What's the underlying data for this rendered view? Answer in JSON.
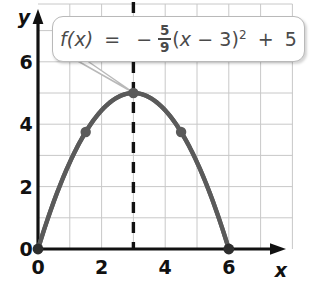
{
  "figure": {
    "axis_labels": {
      "x": "x",
      "y": "y"
    },
    "x_ticks": [
      "0",
      "2",
      "4",
      "6"
    ],
    "y_ticks": [
      "0",
      "2",
      "4",
      "6"
    ],
    "origin_label": "0",
    "colors": {
      "curve": "#5a5a5a",
      "axis": "#111111",
      "grid": "#c8c8c8",
      "point": "#5a5a5a",
      "dashed": "#111111",
      "callout_border": "#b9b9b9",
      "equation_text": "#4a4a4a",
      "background": "#ffffff"
    }
  },
  "callout": {
    "equation": {
      "lhs": "f(x)",
      "equals": "=",
      "minus": "−",
      "numerator": "5",
      "denominator": "9",
      "open_paren": "(",
      "var": "x",
      "minus2": "−",
      "shift": "3",
      "close_paren": ")",
      "exponent": "2",
      "plus": "+",
      "constant": "5",
      "plain": "f(x) = -5/9(x - 3)^2 + 5"
    }
  },
  "chart_data": {
    "type": "line",
    "title": "",
    "xlabel": "x",
    "ylabel": "y",
    "xlim": [
      0,
      8
    ],
    "ylim": [
      0,
      7
    ],
    "grid": true,
    "legend": "none",
    "function": "f(x) = -5/9(x - 3)^2 + 5",
    "vertex": [
      3,
      5
    ],
    "axis_of_symmetry": 3,
    "roots": [
      0,
      6
    ],
    "x_tick_values": [
      0,
      2,
      4,
      6
    ],
    "y_tick_values": [
      0,
      2,
      4,
      6
    ],
    "marked_points": [
      {
        "x": 0,
        "y": 0,
        "label": "x-intercept"
      },
      {
        "x": 1.5,
        "y": 3.75,
        "label": "point"
      },
      {
        "x": 3,
        "y": 5,
        "label": "vertex"
      },
      {
        "x": 4.5,
        "y": 3.75,
        "label": "point"
      },
      {
        "x": 6,
        "y": 0,
        "label": "x-intercept"
      }
    ],
    "series": [
      {
        "name": "f(x)",
        "x": [
          0,
          0.25,
          0.5,
          0.75,
          1,
          1.25,
          1.5,
          1.75,
          2,
          2.25,
          2.5,
          2.75,
          3,
          3.25,
          3.5,
          3.75,
          4,
          4.25,
          4.5,
          4.75,
          5,
          5.25,
          5.5,
          5.75,
          6
        ],
        "y": [
          0,
          1.215,
          2.361,
          3.438,
          4.444,
          5.0,
          3.75,
          4.844,
          4.444,
          4.722,
          4.861,
          4.965,
          5,
          4.965,
          4.861,
          4.722,
          4.444,
          4.097,
          3.75,
          3.264,
          2.778,
          2.153,
          1.528,
          0.764,
          0
        ]
      }
    ]
  }
}
